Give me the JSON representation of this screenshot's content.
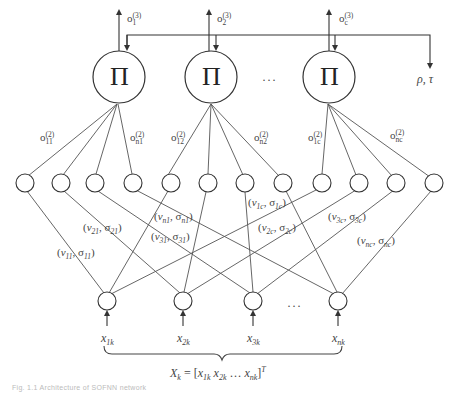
{
  "diagram": {
    "title": "Architecture of SOFNN network",
    "caption": "Fig. 1.1   Architecture of SOFNN network",
    "product_nodes": [
      {
        "symbol": "Π",
        "output_label": "o",
        "output_sub": "1",
        "output_sup": "(3)"
      },
      {
        "symbol": "Π",
        "output_label": "o",
        "output_sub": "2",
        "output_sup": "(3)"
      },
      {
        "symbol": "Π",
        "output_label": "o",
        "output_sub": "c",
        "output_sup": "(3)"
      }
    ],
    "product_ellipsis": "···",
    "feedback_output_label": "ρ, τ",
    "layer2_output_labels": [
      {
        "base": "o",
        "sub": "11",
        "sup": "(2)"
      },
      {
        "base": "o",
        "sub": "n1",
        "sup": "(2)"
      },
      {
        "base": "o",
        "sub": "12",
        "sup": "(2)"
      },
      {
        "base": "o",
        "sub": "n2",
        "sup": "(2)"
      },
      {
        "base": "o",
        "sub": "1c",
        "sup": "(2)"
      },
      {
        "base": "o",
        "sub": "nc",
        "sup": "(2)"
      }
    ],
    "weight_labels": [
      {
        "v": "v",
        "vsub": "11",
        "s": "σ",
        "ssub": "11"
      },
      {
        "v": "v",
        "vsub": "21",
        "s": "σ",
        "ssub": "21"
      },
      {
        "v": "v",
        "vsub": "n1",
        "s": "σ",
        "ssub": "n1"
      },
      {
        "v": "v",
        "vsub": "31",
        "s": "σ",
        "ssub": "31"
      },
      {
        "v": "v",
        "vsub": "1c",
        "s": "σ",
        "ssub": "1c"
      },
      {
        "v": "v",
        "vsub": "2c",
        "s": "σ",
        "ssub": "2c"
      },
      {
        "v": "v",
        "vsub": "3c",
        "s": "σ",
        "ssub": "3c"
      },
      {
        "v": "v",
        "vsub": "nc",
        "s": "σ",
        "ssub": "nc"
      }
    ],
    "hidden_node_count": 12,
    "inputs": [
      {
        "base": "x",
        "sub": "1k"
      },
      {
        "base": "x",
        "sub": "2k"
      },
      {
        "base": "x",
        "sub": "3k"
      },
      {
        "base": "x",
        "sub": "nk"
      }
    ],
    "input_ellipsis": "···",
    "input_vector": {
      "lhs": "X",
      "lhs_sub": "k",
      "equals": " = [",
      "terms": [
        {
          "base": "x",
          "sub": "1k"
        },
        {
          "base": "x",
          "sub": "2k"
        },
        {
          "ellipsis": "…"
        },
        {
          "base": "x",
          "sub": "nk"
        }
      ],
      "close": "]",
      "sup": "T"
    },
    "colors": {
      "line": "#555555",
      "node_stroke": "#333333",
      "text": "#444444",
      "background": "#ffffff"
    }
  }
}
